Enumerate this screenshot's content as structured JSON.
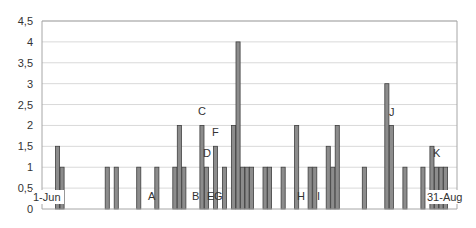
{
  "chart_data": {
    "type": "bar",
    "title": "",
    "xlabel": "",
    "ylabel": "",
    "ylim": [
      0,
      4.5
    ],
    "yticks": [
      "0",
      "0,5",
      "1",
      "1,5",
      "2",
      "2,5",
      "3",
      "3,5",
      "4",
      "4,5"
    ],
    "grid": true,
    "legend": null,
    "x_range_labels": {
      "start": "1-Jun",
      "end": "31-Aug"
    },
    "days_total": 92,
    "bar_color": "#8c8c8c",
    "bar_border_color": "#3f3f3f",
    "gridline_color": "#d9d9d9",
    "series": [
      {
        "name": "Series1",
        "points": [
          {
            "day": 3,
            "value": 1.5
          },
          {
            "day": 4,
            "value": 1
          },
          {
            "day": 14,
            "value": 1
          },
          {
            "day": 16,
            "value": 1
          },
          {
            "day": 21,
            "value": 1
          },
          {
            "day": 25,
            "value": 1
          },
          {
            "day": 29,
            "value": 1
          },
          {
            "day": 30,
            "value": 2
          },
          {
            "day": 31,
            "value": 1
          },
          {
            "day": 35,
            "value": 2
          },
          {
            "day": 36,
            "value": 1
          },
          {
            "day": 38,
            "value": 1.5
          },
          {
            "day": 40,
            "value": 1
          },
          {
            "day": 42,
            "value": 2
          },
          {
            "day": 43,
            "value": 4
          },
          {
            "day": 44,
            "value": 1
          },
          {
            "day": 45,
            "value": 1
          },
          {
            "day": 46,
            "value": 1
          },
          {
            "day": 49,
            "value": 1
          },
          {
            "day": 50,
            "value": 1
          },
          {
            "day": 53,
            "value": 1
          },
          {
            "day": 56,
            "value": 2
          },
          {
            "day": 59,
            "value": 1
          },
          {
            "day": 60,
            "value": 1
          },
          {
            "day": 63,
            "value": 1.5
          },
          {
            "day": 64,
            "value": 1
          },
          {
            "day": 65,
            "value": 2
          },
          {
            "day": 71,
            "value": 1
          },
          {
            "day": 76,
            "value": 3
          },
          {
            "day": 77,
            "value": 2
          },
          {
            "day": 80,
            "value": 1
          },
          {
            "day": 84,
            "value": 1
          },
          {
            "day": 86,
            "value": 1.5
          },
          {
            "day": 87,
            "value": 1
          },
          {
            "day": 88,
            "value": 1
          },
          {
            "day": 89,
            "value": 1
          }
        ]
      }
    ],
    "annotations": [
      {
        "text": "A",
        "x": 148,
        "y": 200
      },
      {
        "text": "B",
        "x": 192,
        "y": 200
      },
      {
        "text": "C",
        "x": 198,
        "y": 115
      },
      {
        "text": "D",
        "x": 203,
        "y": 157
      },
      {
        "text": "E",
        "x": 207,
        "y": 200
      },
      {
        "text": "F",
        "x": 212,
        "y": 136
      },
      {
        "text": "G",
        "x": 214,
        "y": 200
      },
      {
        "text": "H",
        "x": 297,
        "y": 200
      },
      {
        "text": "I",
        "x": 317,
        "y": 200
      },
      {
        "text": "J",
        "x": 389,
        "y": 116
      },
      {
        "text": "K",
        "x": 433,
        "y": 157
      }
    ]
  }
}
